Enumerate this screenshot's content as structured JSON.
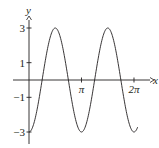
{
  "chart_data": {
    "type": "line",
    "title": "",
    "function": "y = -3 cos(2x)",
    "xlabel": "x",
    "ylabel": "y",
    "xlim": [
      -0.9,
      7.2
    ],
    "ylim": [
      -3.5,
      3.8
    ],
    "x_ticks": [
      {
        "value": 3.14159,
        "label": "π"
      },
      {
        "value": 6.28318,
        "label": "2π"
      }
    ],
    "y_ticks": [
      {
        "value": 3,
        "label": "3"
      },
      {
        "value": 1,
        "label": "1"
      },
      {
        "value": -1,
        "label": "−1"
      },
      {
        "value": -3,
        "label": "−3"
      }
    ],
    "series": [
      {
        "name": "y = -3cos(2x)",
        "x": [
          0,
          0.3927,
          0.7854,
          1.1781,
          1.5708,
          1.9635,
          2.3562,
          2.7489,
          3.1416,
          3.5343,
          3.927,
          4.3197,
          4.7124,
          5.1051,
          5.4978,
          5.8905,
          6.2832,
          6.5
        ],
        "values": [
          -3,
          -2.12,
          0,
          2.12,
          3,
          2.12,
          0,
          -2.12,
          -3,
          -2.12,
          0,
          2.12,
          3,
          2.12,
          0,
          -2.12,
          -3,
          -2.73
        ],
        "color": "#231f20"
      }
    ],
    "grid": false,
    "legend": "none"
  },
  "axes": {
    "x_label": "x",
    "y_label": "y"
  }
}
